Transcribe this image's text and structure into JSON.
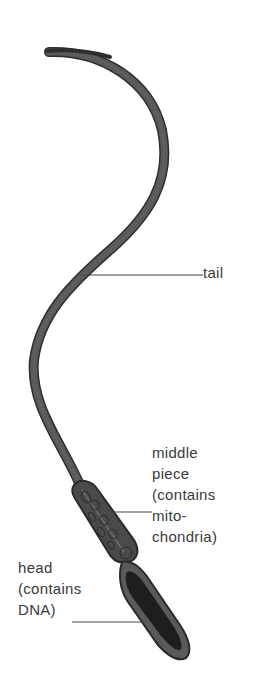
{
  "diagram": {
    "labels": {
      "tail": "tail",
      "middle_piece": "middle\npiece\n(contains\nmito-\nchondria)",
      "head": "head\n(contains\nDNA)"
    },
    "colors": {
      "tail_fill": "#555555",
      "outline": "#2e2e2e",
      "head_fill": "#1e1e1e",
      "leader_line": "#444444",
      "text": "#3a3a3a"
    }
  }
}
